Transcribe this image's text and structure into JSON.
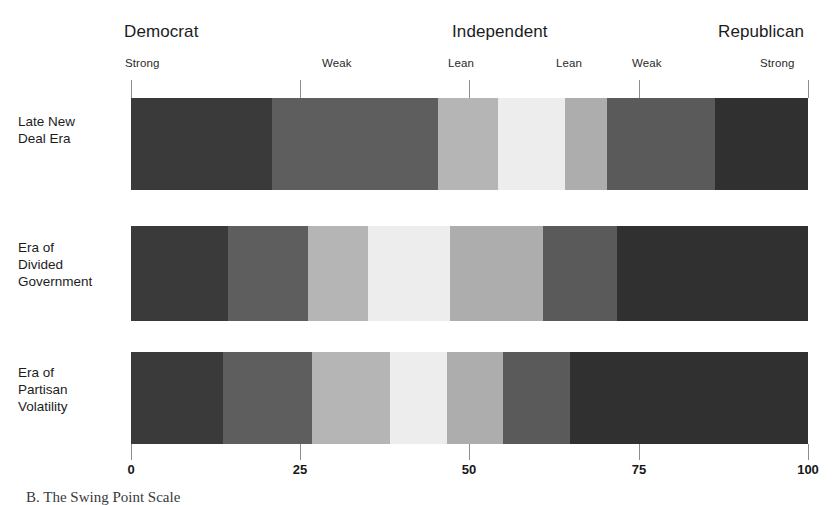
{
  "figure": {
    "caption": "B. The Swing Point Scale"
  },
  "axis": {
    "top_groups": [
      {
        "label": "Democrat",
        "x": 124
      },
      {
        "label": "Independent",
        "x": 452
      },
      {
        "label": "Republican",
        "x": 718
      }
    ],
    "strength_labels": [
      {
        "label": "Strong",
        "x": 125
      },
      {
        "label": "Weak",
        "x": 322
      },
      {
        "label": "Lean",
        "x": 448
      },
      {
        "label": "Lean",
        "x": 556
      },
      {
        "label": "Weak",
        "x": 632
      },
      {
        "label": "Strong",
        "x": 760
      }
    ],
    "ticks": [
      0,
      25,
      50,
      75,
      100
    ],
    "tick_labels": [
      "0",
      "25",
      "50",
      "75",
      "100"
    ],
    "xmin": 0,
    "xmax": 100
  },
  "rows": [
    {
      "label": "Late New\nDeal Era"
    },
    {
      "label": "Era of\nDivided\nGovernment"
    },
    {
      "label": "Era of\nPartisan\nVolatility"
    }
  ],
  "palette": {
    "strong_dem": "#3a3a3a",
    "weak_dem": "#5e5e5e",
    "lean_dem": "#b5b5b5",
    "independent": "#ededed",
    "lean_rep": "#adadad",
    "weak_rep": "#5a5a5a",
    "strong_rep": "#303030",
    "tick": "#8d8d8d",
    "background": "#ffffff"
  },
  "chart_data": {
    "type": "bar",
    "title": "B. The Swing Point Scale",
    "xlabel": "",
    "ylabel": "",
    "xlim": [
      0,
      100
    ],
    "grid": false,
    "legend": "top-inline",
    "orientation": "horizontal",
    "stacked": true,
    "categories": [
      "Late New Deal Era",
      "Era of Divided Government",
      "Era of Partisan Volatility"
    ],
    "segment_names": [
      "Strong Democrat",
      "Weak Democrat",
      "Lean Democrat",
      "Independent",
      "Lean Republican",
      "Weak Republican",
      "Strong Republican"
    ],
    "segment_colors": [
      "#3a3a3a",
      "#5e5e5e",
      "#b5b5b5",
      "#ededed",
      "#adadad",
      "#5a5a5a",
      "#303030"
    ],
    "series": [
      {
        "name": "Strong Democrat",
        "values": [
          20.8,
          14.3,
          13.6
        ]
      },
      {
        "name": "Weak Democrat",
        "values": [
          24.5,
          11.8,
          13.1
        ]
      },
      {
        "name": "Lean Democrat",
        "values": [
          8.9,
          8.9,
          11.6
        ]
      },
      {
        "name": "Independent",
        "values": [
          9.9,
          12.1,
          8.4
        ]
      },
      {
        "name": "Lean Republican",
        "values": [
          6.2,
          13.8,
          8.3
        ]
      },
      {
        "name": "Weak Republican",
        "values": [
          16.0,
          10.9,
          9.8
        ]
      },
      {
        "name": "Strong Republican",
        "values": [
          13.7,
          28.2,
          35.2
        ]
      }
    ],
    "cumulative_boundaries": [
      [
        0,
        20.8,
        45.3,
        54.2,
        64.1,
        70.3,
        86.3,
        100
      ],
      [
        0,
        14.3,
        26.1,
        35.0,
        47.1,
        60.9,
        71.8,
        100
      ],
      [
        0,
        13.6,
        26.7,
        38.3,
        46.7,
        55.0,
        64.8,
        100
      ]
    ]
  },
  "layout": {
    "plot_left": 131,
    "plot_right": 808,
    "bar_tops": [
      98,
      226,
      352
    ],
    "bar_heights": [
      92,
      95,
      92
    ],
    "tick_top_y": 80,
    "tick_top_h": 18,
    "tick_bottom_y": 444,
    "tick_bottom_h": 16,
    "axis_num_y": 452
  }
}
